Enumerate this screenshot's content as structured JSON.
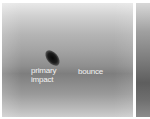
{
  "figure": {
    "panels": [
      {
        "id": "left",
        "description": "grayscale photograph showing dark elongated particle above a horizontal band",
        "annotations": [
          {
            "line1": "primary",
            "line2": "impact"
          },
          {
            "line1": "bounce"
          }
        ]
      },
      {
        "id": "right",
        "description": "adjacent grayscale panel, partially cropped"
      }
    ],
    "colors": {
      "background": "#ffffff",
      "label": "#f2f2f2",
      "blob": "#0a0a0a"
    }
  }
}
